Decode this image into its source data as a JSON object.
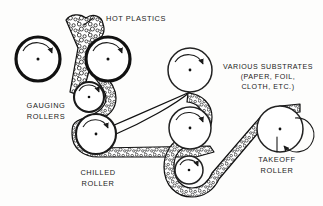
{
  "figure": {
    "background_color": "#fdfdfc",
    "ink_color": "#111111"
  },
  "labels": {
    "hot_plastics": "HOT PLASTICS",
    "gauging_rollers_line1": "GAUGING",
    "gauging_rollers_line2": "ROLLERS",
    "chilled_roller_line1": "CHILLED",
    "chilled_roller_line2": "ROLLER",
    "various_substrates_line1": "VARIOUS SUBSTRATES",
    "various_substrates_line2": "(PAPER, FOIL,",
    "various_substrates_line3": "CLOTH, ETC.)",
    "takeoff_roller_line1": "TAKEOFF",
    "takeoff_roller_line2": "ROLLER"
  },
  "rollers": [
    {
      "name": "nip-roller-left",
      "cx": 38,
      "cy": 59,
      "r": 22,
      "weight": "heavy",
      "rotation": "clockwise"
    },
    {
      "name": "nip-roller-right",
      "cx": 108,
      "cy": 59,
      "r": 22,
      "weight": "heavy",
      "rotation": "clockwise"
    },
    {
      "name": "gauging-roller-upper",
      "cx": 89,
      "cy": 97,
      "r": 15,
      "weight": "medium",
      "rotation": "clockwise"
    },
    {
      "name": "chilled-roller",
      "cx": 96,
      "cy": 134,
      "r": 20,
      "weight": "medium",
      "rotation": "clockwise"
    },
    {
      "name": "idler-roller-top",
      "cx": 190,
      "cy": 70,
      "r": 22,
      "weight": "light",
      "rotation": "clockwise"
    },
    {
      "name": "idler-roller-middle",
      "cx": 190,
      "cy": 128,
      "r": 21,
      "weight": "light",
      "rotation": "clockwise"
    },
    {
      "name": "idler-roller-lower",
      "cx": 189,
      "cy": 170,
      "r": 14,
      "weight": "light",
      "rotation": "clockwise"
    },
    {
      "name": "takeoff-roller",
      "cx": 280,
      "cy": 129,
      "r": 23,
      "weight": "light",
      "rotation": "clockwise"
    }
  ],
  "webs": {
    "hot_plastic_melt": "stippled textured band entering the nip from above",
    "substrate_line": "thin plain line from upper idler down to the chilled roller",
    "coated_web": "stippled band routed over the idler rollers to the takeoff roller"
  }
}
